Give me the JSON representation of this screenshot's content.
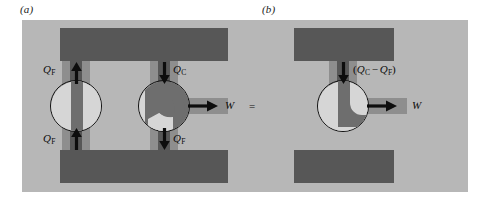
{
  "figure": {
    "type": "thermodynamic-cycle-schematic",
    "caption_letters": {
      "a": "(a)",
      "b": "(b)"
    },
    "colors": {
      "page_background": "#ffffff",
      "field_background": "#b7b7b7",
      "reservoir_block": "#575757",
      "pipe_mid": "#8e8e8e",
      "cycle_light": "#d6d6d6",
      "cycle_dark": "#6e6e6e",
      "outline": "#111111",
      "text": "#0d0d0d"
    }
  },
  "panel_a": {
    "label": "(a)",
    "labels": {
      "q_f_top_left": {
        "symbol": "Q",
        "subscript": "F"
      },
      "q_f_bottom_left": {
        "symbol": "Q",
        "subscript": "F"
      },
      "q_c_top_right": {
        "symbol": "Q",
        "subscript": "C"
      },
      "q_f_bottom_right": {
        "symbol": "Q",
        "subscript": "F"
      },
      "w_output": {
        "symbol": "W"
      }
    },
    "arrows": [
      {
        "name": "q-f-up-left-top",
        "direction": "up"
      },
      {
        "name": "q-f-up-left-bottom",
        "direction": "up"
      },
      {
        "name": "q-c-down-right-top",
        "direction": "down"
      },
      {
        "name": "q-f-down-right-bottom",
        "direction": "down"
      },
      {
        "name": "w-right-out",
        "direction": "right"
      }
    ],
    "cycles": [
      {
        "name": "refrigerator-cycle",
        "style": "light-disc-with-vertical-dark-band"
      },
      {
        "name": "heat-engine-cycle",
        "style": "dark-disc-with-light-crescent-and-wedge"
      }
    ]
  },
  "panel_b": {
    "label": "(b)",
    "labels": {
      "q_difference": {
        "open": "(",
        "first_symbol": "Q",
        "first_subscript": "C",
        "operator": "−",
        "second_symbol": "Q",
        "second_subscript": "F",
        "close": ")",
        "text": "(QC − QF)"
      },
      "w_output": {
        "symbol": "W"
      }
    },
    "equals_sign": "=",
    "arrows": [
      {
        "name": "q-difference-down",
        "direction": "down"
      },
      {
        "name": "w-right-out",
        "direction": "right"
      }
    ],
    "cycles": [
      {
        "name": "combined-engine-cycle",
        "style": "light-crescent-with-dark-hook"
      }
    ]
  }
}
